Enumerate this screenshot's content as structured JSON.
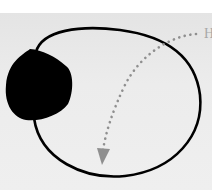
{
  "diagram": {
    "label_partial": "H",
    "colors": {
      "background": "#ebebeb",
      "top_strip": "#ffffff",
      "loop_stroke": "#000000",
      "blob_fill": "#000000",
      "arrow_color": "#8f8f8f",
      "label_color": "#a8a8a8"
    },
    "elements": [
      {
        "type": "blob",
        "description": "solid black irregular shape on left"
      },
      {
        "type": "closed-loop",
        "description": "black outline loop attached to blob"
      },
      {
        "type": "dotted-arrow",
        "description": "gray dotted curved arrow from right edge label down to bottom, arrowhead pointing down"
      }
    ]
  }
}
